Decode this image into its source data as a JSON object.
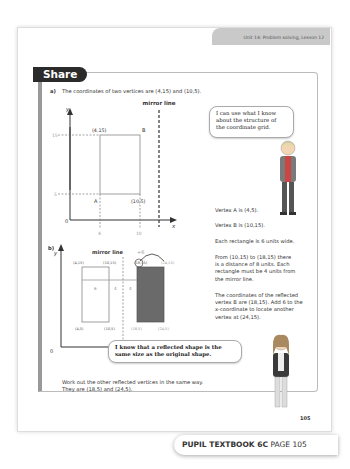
{
  "header": {
    "unit": "Unit 14: Problem solving, Lesson 12"
  },
  "section": {
    "title": "Share"
  },
  "part_a": {
    "label": "a)",
    "intro": "The coordinates of two vertices are (4,15) and (10,5).",
    "mirror_label": "mirror line",
    "axis_x": "x",
    "axis_y": "y",
    "origin": "0",
    "y_ticks": [
      "15",
      "5"
    ],
    "x_ticks": [
      "4",
      "10"
    ],
    "point_top_left": "(4,15)",
    "point_B": "B",
    "point_A": "A",
    "point_bottom_right": "(10,5)",
    "bubble": [
      "I can use what I know",
      "about the structure of",
      "the coordinate grid."
    ],
    "vertex_a": "Vertex A is (4,5).",
    "vertex_b": "Vertex B is (10,15).",
    "width_note": "Each rectangle is 6 units wide.",
    "distance_note": [
      "From (10,15) to (18,15) there",
      "is a distance of 8 units. Each",
      "rectangle must be 4 units from",
      "the mirror line."
    ],
    "reflect_note": [
      "The coordinates of the reflected",
      "vertex B are (18,15). Add 6 to the",
      "x-coordinate to locate another",
      "vertex at (24,15)."
    ]
  },
  "part_b": {
    "label": "b)",
    "mirror_label": "mirror line",
    "plus": "+6",
    "axis_x": "x",
    "axis_y": "y",
    "origin": "0",
    "labels_top": [
      "(4,15)",
      "(10,15)",
      "(18,15)",
      "(24,15)"
    ],
    "labels_bottom": [
      "(4,5)",
      "(10,5)",
      "(18,5)",
      "(24,5)"
    ],
    "dist": [
      "6",
      "4",
      "4"
    ],
    "bubble": [
      "I know that a reflected shape is the",
      "same size as the original shape."
    ],
    "conclusion": [
      "Work out the other reflected vertices in the same way.",
      "They are (18,5) and (24,5)."
    ]
  },
  "page_number": "105",
  "footer": {
    "book": "PUPIL TEXTBOOK 6C",
    "page": "PAGE 105"
  }
}
